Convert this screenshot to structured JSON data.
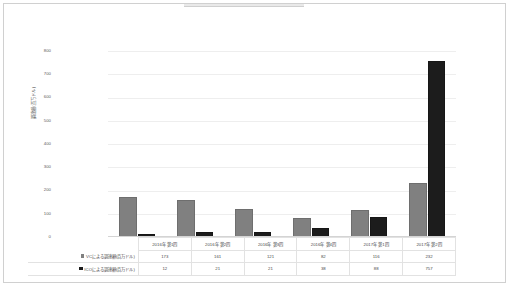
{
  "frame": {
    "border_color": "#d0d0d0"
  },
  "chart_data": {
    "type": "bar",
    "title": "",
    "xlabel": "",
    "ylabel": "調達額(百万ドル)",
    "ylim": [
      0,
      800
    ],
    "ytick_step": 100,
    "yticks": [
      "800",
      "700",
      "600",
      "500",
      "400",
      "300",
      "200",
      "100",
      "0"
    ],
    "grid": true,
    "legend_position": "data-table",
    "categories": [
      "2016年 第1四",
      "2016年 第2四",
      "2016年 第3四",
      "2016年 第4四",
      "2017年 第1四",
      "2017年 第2四"
    ],
    "series": [
      {
        "name": "VCによる調達額(百万ドル)",
        "color": "#808080",
        "values": [
          173,
          161,
          121,
          82,
          116,
          232
        ]
      },
      {
        "name": "ICOによる調達額(百万ドル)",
        "color": "#1c1c1c",
        "values": [
          12,
          21,
          21,
          38,
          88,
          757
        ]
      }
    ]
  }
}
